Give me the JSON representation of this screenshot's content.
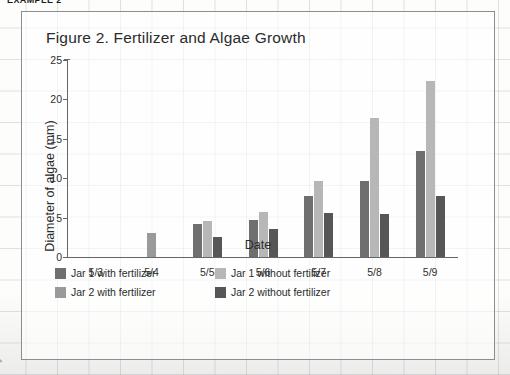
{
  "example_label": "EXAMPLE 2",
  "figure": {
    "title": "Figure 2. Fertilizer and Algae Growth"
  },
  "chart_data": {
    "type": "bar",
    "title": "Figure 2. Fertilizer and Algae Growth",
    "xlabel": "Date",
    "ylabel": "Diameter of algae (mm)",
    "categories": [
      "5/3",
      "5/4",
      "5/5",
      "5/6",
      "5/7",
      "5/8",
      "5/9"
    ],
    "yticks": [
      0,
      5,
      10,
      15,
      20,
      25
    ],
    "ylim": [
      0,
      25
    ],
    "grid": false,
    "legend_position": "bottom-left",
    "series": [
      {
        "name": "Jar 1 with fertilizer",
        "color": "#6f6f6f",
        "values": [
          0,
          0,
          4.2,
          4.7,
          7.8,
          9.6,
          13.4
        ]
      },
      {
        "name": "Jar 1 without fertilizer",
        "color": "#b7b7b7",
        "values": [
          0,
          0,
          4.6,
          5.7,
          9.6,
          17.7,
          22.4
        ]
      },
      {
        "name": "Jar 2 with fertilizer",
        "color": "#9a9a9a",
        "values": [
          0,
          3.0,
          0,
          0,
          0,
          0,
          0
        ]
      },
      {
        "name": "Jar 2 without fertilizer",
        "color": "#565656",
        "values": [
          0,
          0,
          2.6,
          3.6,
          5.6,
          5.5,
          7.7
        ]
      }
    ]
  },
  "legend": [
    {
      "label": "Jar 1 with fertilizer",
      "swatch": "s0"
    },
    {
      "label": "Jar 1 without fertilizer",
      "swatch": "s1"
    },
    {
      "label": "Jar 2 with fertilizer",
      "swatch": "s2"
    },
    {
      "label": "Jar 2 without fertilizer",
      "swatch": "s3"
    }
  ]
}
